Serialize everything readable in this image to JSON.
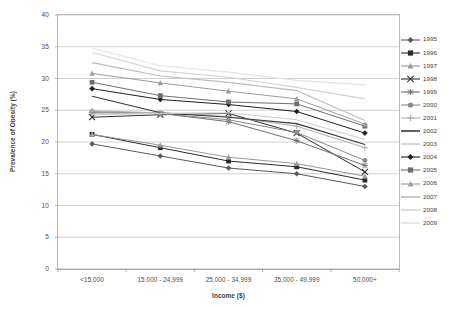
{
  "chart_data": {
    "type": "line",
    "title": "",
    "xlabel": "Income ($)",
    "ylabel": "Prevalence of Obesity (%)",
    "categories": [
      "<15,000",
      "15,000 - 24,999",
      "25,000 - 34,999",
      "35,000 - 49,999",
      "50,000+"
    ],
    "ylim": [
      0,
      40
    ],
    "yticks": [
      0,
      5,
      10,
      15,
      20,
      25,
      30,
      35,
      40
    ],
    "grid": true,
    "legend_position": "right",
    "series": [
      {
        "name": "1995",
        "color": "#5a5a5a",
        "marker": "diamond",
        "values": [
          19.7,
          17.8,
          15.9,
          15.0,
          13.0
        ]
      },
      {
        "name": "1996",
        "color": "#2b2b2b",
        "marker": "square",
        "values": [
          21.2,
          19.1,
          17.0,
          16.1,
          14.0
        ]
      },
      {
        "name": "1997",
        "color": "#9a9a9a",
        "marker": "triangle",
        "values": [
          21.2,
          19.5,
          17.6,
          16.6,
          14.6
        ]
      },
      {
        "name": "1998",
        "color": "#2f2f2f",
        "marker": "cross",
        "values": [
          23.9,
          24.3,
          24.5,
          21.4,
          15.3
        ]
      },
      {
        "name": "1999",
        "color": "#707070",
        "marker": "star",
        "values": [
          24.6,
          24.5,
          23.2,
          20.2,
          16.3
        ]
      },
      {
        "name": "2000",
        "color": "#8a8a8a",
        "marker": "circle",
        "values": [
          24.8,
          24.5,
          23.5,
          21.5,
          17.1
        ]
      },
      {
        "name": "2001",
        "color": "#b0b0b0",
        "marker": "plus",
        "values": [
          24.9,
          24.6,
          24.0,
          22.5,
          19.1
        ]
      },
      {
        "name": "2002",
        "color": "#383838",
        "marker": "none",
        "values": [
          27.2,
          24.6,
          23.9,
          22.9,
          19.6
        ]
      },
      {
        "name": "2003",
        "color": "#cfcfcf",
        "marker": "none",
        "values": [
          24.3,
          24.5,
          24.6,
          23.5,
          20.4
        ]
      },
      {
        "name": "2004",
        "color": "#1f1f1f",
        "marker": "diamond",
        "values": [
          28.4,
          26.7,
          25.9,
          24.8,
          21.4
        ]
      },
      {
        "name": "2005",
        "color": "#6e6e6e",
        "marker": "square",
        "values": [
          29.4,
          27.3,
          26.3,
          26.0,
          22.5
        ]
      },
      {
        "name": "2006",
        "color": "#9d9d9d",
        "marker": "triangle",
        "values": [
          30.8,
          29.3,
          28.0,
          26.8,
          22.8
        ]
      },
      {
        "name": "2007",
        "color": "#bcbcbc",
        "marker": "none",
        "values": [
          32.5,
          30.4,
          29.4,
          28.1,
          23.4
        ]
      },
      {
        "name": "2008",
        "color": "#d4d4d4",
        "marker": "none",
        "values": [
          34.1,
          31.2,
          30.2,
          28.6,
          26.8
        ]
      },
      {
        "name": "2009",
        "color": "#e3e3e3",
        "marker": "none",
        "values": [
          34.8,
          32.0,
          31.0,
          29.7,
          29.0
        ]
      }
    ]
  }
}
